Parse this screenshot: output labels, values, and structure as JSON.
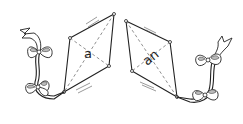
{
  "illustration": {
    "description": "Two line-drawn kites with bow-tied tails",
    "kites": [
      {
        "id": "left",
        "word": "a"
      },
      {
        "id": "right",
        "word": "an"
      }
    ],
    "colors": {
      "ink": "#222222",
      "background": "#ffffff"
    }
  }
}
